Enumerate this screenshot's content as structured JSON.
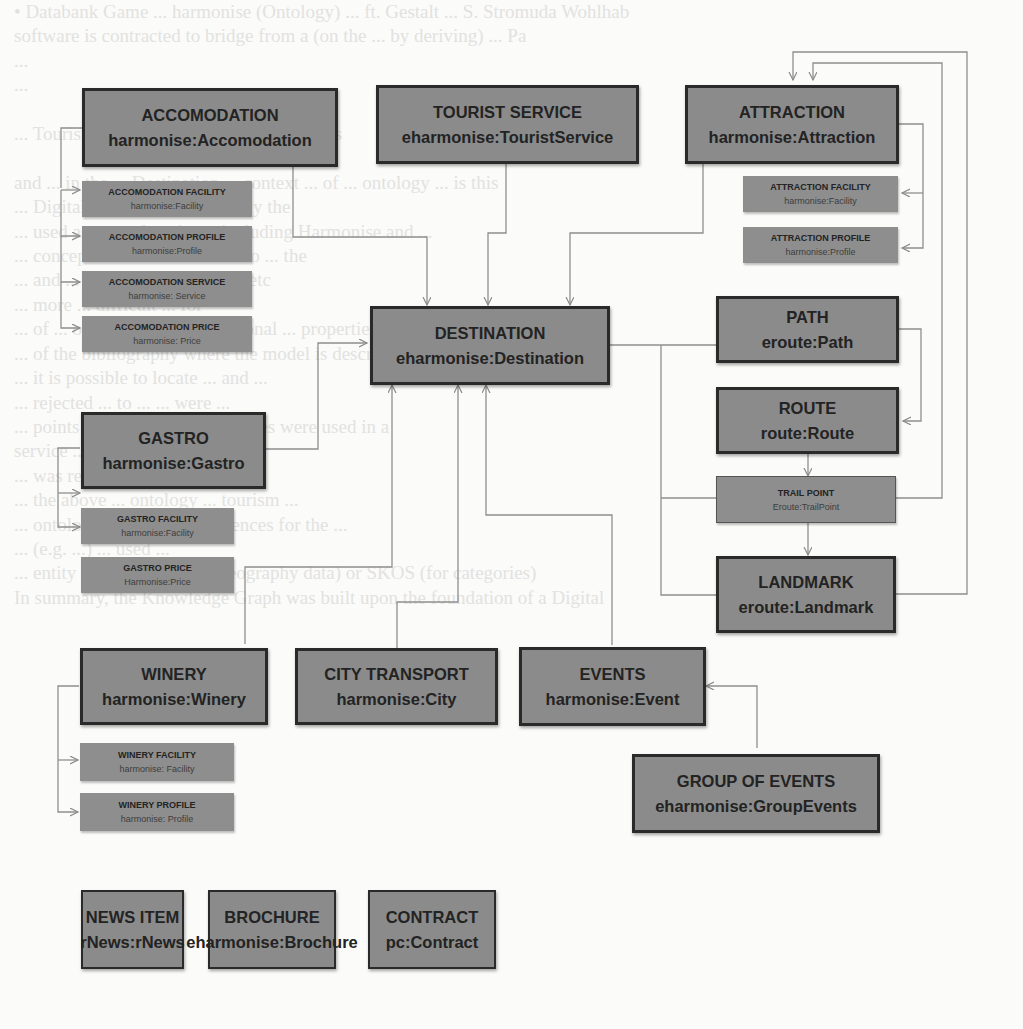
{
  "background_text": "• Databank Game ... harmonise (Ontology) ... ft. Gestalt ... S. Stromuda Wohlhab\nsoftware is contracted to bridge from a (on the ... by deriving) ... Pa\n...\n...\n\n... Tourism Organization (WTO) Thesaurus\n\nand ... in the ... Destination ... context ... of ... ontology ... is this\n... Digital Model ... for ... mainly the\n... used as several projects, including Harmonise and ...\n... concepts ... to ... are able ... to ... the\n... and ... Harmonise ... Gull ... etc\n... more ... difficult ... for\n... of ... ontology ... and ... regional ... properties ... designed ... to be\n... of the bibliography where the model is described\n... it is possible to locate ... and ...\n... rejected ... to ... ... were ...\n... points however ... the ... entities were used in a\nservice ...\n... was required ...\n... the above ... ontology ... tourism ...\n... ontology ... model ... references for the ...\n... (e.g. ...) ... used ...\n... entity ... Geonames (for geography data) or SKOS (for categories)\nIn summary, the Knowledge Graph was built upon the foundation of a Digital",
  "diagram": {
    "title": "",
    "nodes": {
      "accomodation": {
        "label": "ACCOMODATION",
        "uri": "harmonise:Accomodation"
      },
      "tourist_service": {
        "label": "TOURIST SERVICE",
        "uri": "eharmonise:TouristService"
      },
      "attraction": {
        "label": "ATTRACTION",
        "uri": "harmonise:Attraction"
      },
      "accomodation_facility": {
        "label": "ACCOMODATION FACILITY",
        "uri": "harmonise:Facility"
      },
      "accomodation_profile": {
        "label": "ACCOMODATION PROFILE",
        "uri": "harmonise:Profile"
      },
      "accomodation_service": {
        "label": "ACCOMODATION SERVICE",
        "uri": "harmonise: Service"
      },
      "accomodation_price": {
        "label": "ACCOMODATION  PRICE",
        "uri": "harmonise: Price"
      },
      "attraction_facility": {
        "label": "ATTRACTION FACILITY",
        "uri": "harmonise:Facility"
      },
      "attraction_profile": {
        "label": "ATTRACTION  PROFILE",
        "uri": "harmonise:Profile"
      },
      "destination": {
        "label": "DESTINATION",
        "uri": "eharmonise:Destination"
      },
      "path": {
        "label": "PATH",
        "uri": "eroute:Path"
      },
      "route": {
        "label": "ROUTE",
        "uri": "route:Route"
      },
      "gastro": {
        "label": "GASTRO",
        "uri": "harmonise:Gastro"
      },
      "gastro_facility": {
        "label": "GASTRO  FACILITY",
        "uri": "harmonise:Facility"
      },
      "gastro_price": {
        "label": "GASTRO PRICE",
        "uri": "Harmonise:Price"
      },
      "trail_point": {
        "label": "TRAIL POINT",
        "uri": "Eroute:TrailPoint"
      },
      "landmark": {
        "label": "LANDMARK",
        "uri": "eroute:Landmark"
      },
      "winery": {
        "label": "WINERY",
        "uri": "harmonise:Winery"
      },
      "city_transport": {
        "label": "CITY TRANSPORT",
        "uri": "harmonise:City"
      },
      "events": {
        "label": "EVENTS",
        "uri": "harmonise:Event"
      },
      "group_of_events": {
        "label": "GROUP OF EVENTS",
        "uri": "eharmonise:GroupEvents"
      },
      "winery_facility": {
        "label": "WINERY FACILITY",
        "uri": "harmonise: Facility"
      },
      "winery_profile": {
        "label": "WINERY PROFILE",
        "uri": "harmonise: Profile"
      },
      "news_item": {
        "label": "NEWS ITEM",
        "uri": "rNews:rNews"
      },
      "brochure": {
        "label": "BROCHURE",
        "uri": "eharmonise:Brochure"
      },
      "contract": {
        "label": "CONTRACT",
        "uri": "pc:Contract"
      }
    },
    "edges": [
      [
        "accomodation",
        "destination"
      ],
      [
        "tourist_service",
        "destination"
      ],
      [
        "attraction",
        "destination"
      ],
      [
        "accomodation",
        "accomodation_facility"
      ],
      [
        "accomodation",
        "accomodation_profile"
      ],
      [
        "accomodation",
        "accomodation_service"
      ],
      [
        "accomodation",
        "accomodation_price"
      ],
      [
        "attraction",
        "attraction_facility"
      ],
      [
        "attraction",
        "attraction_profile"
      ],
      [
        "gastro",
        "gastro_facility"
      ],
      [
        "gastro",
        "gastro_price"
      ],
      [
        "winery",
        "winery_facility"
      ],
      [
        "winery",
        "winery_profile"
      ],
      [
        "gastro",
        "destination"
      ],
      [
        "winery",
        "destination"
      ],
      [
        "city_transport",
        "destination"
      ],
      [
        "events",
        "destination"
      ],
      [
        "path",
        "destination"
      ],
      [
        "trail_point",
        "destination"
      ],
      [
        "landmark",
        "destination"
      ],
      [
        "path",
        "route"
      ],
      [
        "route",
        "trail_point"
      ],
      [
        "trail_point",
        "landmark"
      ],
      [
        "trail_point",
        "attraction"
      ],
      [
        "landmark",
        "attraction"
      ],
      [
        "group_of_events",
        "events"
      ]
    ],
    "colors": {
      "main_box": "#8b8b8b",
      "border": "#2a2a2a",
      "line": "#8a8a8a",
      "text": "#232323"
    }
  }
}
